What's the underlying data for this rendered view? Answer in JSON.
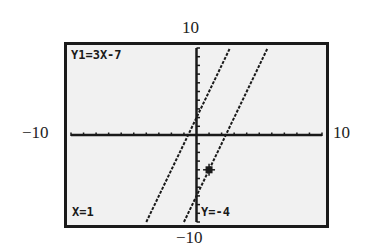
{
  "window": {
    "ymax_label": "10",
    "ymin_label": "−10",
    "xmin_label": "−10",
    "xmax_label": "10"
  },
  "screen": {
    "equation": "Y1=3X-7",
    "trace_x": "X=1",
    "trace_y": "Y=-4",
    "background": "#f1f1f1",
    "ink": "#1a1a1a"
  },
  "chart_data": {
    "type": "line",
    "title": "",
    "xlabel": "",
    "ylabel": "",
    "xlim": [
      -10,
      10
    ],
    "ylim": [
      -10,
      10
    ],
    "x_ticks_every": 1,
    "y_ticks_every": 1,
    "grid": false,
    "series": [
      {
        "name": "Y1=3X-7",
        "slope": 3,
        "intercept": -7,
        "x": [
          -1,
          5.67
        ],
        "y": [
          -10,
          10
        ]
      },
      {
        "name": "parallel line",
        "slope": 3,
        "intercept": 2,
        "x": [
          -4,
          2.67
        ],
        "y": [
          -10,
          10
        ]
      }
    ],
    "trace_point": {
      "x": 1,
      "y": -4,
      "series": "Y1=3X-7"
    },
    "annotations": [
      "Y1=3X-7",
      "X=1",
      "Y=-4"
    ]
  }
}
